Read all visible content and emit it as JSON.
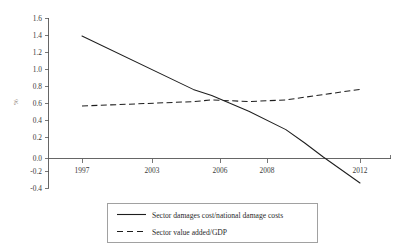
{
  "chart_data": {
    "type": "line",
    "title": "",
    "xlabel": "",
    "ylabel": "%",
    "ylim": [
      -0.4,
      1.6
    ],
    "ytick_labels": [
      "1.6",
      "1.4",
      "1.2",
      "1.0",
      "0.8",
      "0.6",
      "0.4",
      "0.2",
      "0.0",
      "-0.2",
      "-0.4"
    ],
    "ytick_values": [
      1.6,
      1.4,
      1.2,
      1.0,
      0.8,
      0.6,
      0.4,
      0.2,
      0.0,
      -0.2,
      -0.4
    ],
    "xtick_labels": [
      "1997",
      "2003",
      "2006",
      "2008",
      "2012"
    ],
    "xtick_values": [
      1997,
      2003,
      2006,
      2008,
      2012
    ],
    "xlim": [
      1996,
      2013
    ],
    "grid": false,
    "legend_position": "below-center",
    "series": [
      {
        "name": "Sector damages cost/national damage costs",
        "style": "solid",
        "color": "#1e1e1e",
        "x": [
          1997,
          2003,
          2004,
          2006,
          2008,
          2009,
          2010,
          2012
        ],
        "values": [
          1.4,
          0.79,
          0.72,
          0.54,
          0.33,
          0.18,
          0.02,
          -0.28
        ]
      },
      {
        "name": "Sector value added/GDP",
        "style": "dashed",
        "color": "#1e1e1e",
        "x": [
          1997,
          2003,
          2004,
          2006,
          2008,
          2010,
          2012
        ],
        "values": [
          0.6,
          0.65,
          0.67,
          0.65,
          0.67,
          0.73,
          0.79
        ]
      }
    ]
  },
  "legend": {
    "entries": [
      {
        "label": "Sector damages cost/national damage costs",
        "style": "solid"
      },
      {
        "label": "Sector value added/GDP",
        "style": "dashed"
      }
    ]
  },
  "colors": {
    "series": "#1e1e1e",
    "axis": "#555555",
    "axis_title": "#8d7f73",
    "background": "#ffffff"
  }
}
